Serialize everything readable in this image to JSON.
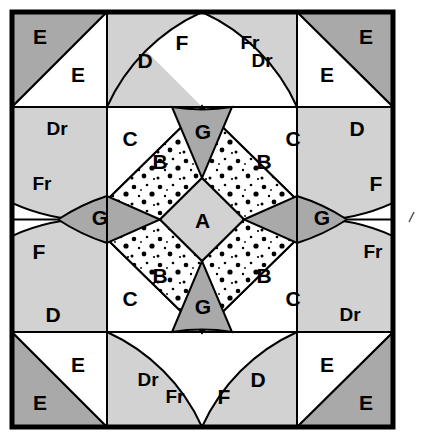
{
  "diagram": {
    "type": "quilt-block-pattern",
    "grid": {
      "rows": 4,
      "columns": 4,
      "block_left": 12,
      "block_top": 12,
      "block_size": 381,
      "cell_size": 95.25
    },
    "colors": {
      "background": "#ffffff",
      "outline": "#000000",
      "fabric_light": "#ffffff",
      "fabric_medium": "#d2d2d2",
      "fabric_dark": "#a9a9a9",
      "fabric_dotted_base": "#ffffff",
      "dot_color": "#000000",
      "border": "#000000"
    },
    "border_width": 4,
    "line_width": 2
  },
  "labels": {
    "center": "A",
    "dotted": "B",
    "triangle_c": "C",
    "triangle_d": "D",
    "triangle_dr": "Dr",
    "corner_dark": "E",
    "corner_light": "E",
    "wedge_f": "F",
    "wedge_fr": "Fr",
    "kite_g": "G"
  },
  "pieces": [
    {
      "id": "A",
      "label": "A",
      "name": "center-diamond",
      "fabric": "medium",
      "x": 202.5,
      "y": 222.0
    },
    {
      "id": "B1",
      "label": "B",
      "name": "dotted-diamond-top-left",
      "fabric": "dotted",
      "x": 160.0,
      "y": 163.0
    },
    {
      "id": "B2",
      "label": "B",
      "name": "dotted-diamond-top-right",
      "fabric": "dotted",
      "x": 264.0,
      "y": 163.0
    },
    {
      "id": "B3",
      "label": "B",
      "name": "dotted-diamond-bottom-left",
      "fabric": "dotted",
      "x": 160.0,
      "y": 277.0
    },
    {
      "id": "B4",
      "label": "B",
      "name": "dotted-diamond-bottom-right",
      "fabric": "dotted",
      "x": 264.0,
      "y": 277.0
    },
    {
      "id": "G1",
      "label": "G",
      "name": "kite-top",
      "fabric": "dark",
      "x": 203.0,
      "y": 110.0
    },
    {
      "id": "G2",
      "label": "G",
      "name": "kite-right",
      "fabric": "dark",
      "x": 325.0,
      "y": 215.0
    },
    {
      "id": "G3",
      "label": "G",
      "name": "kite-bottom",
      "fabric": "dark",
      "x": 203.0,
      "y": 330.0
    },
    {
      "id": "G4",
      "label": "G",
      "name": "kite-left",
      "fabric": "dark",
      "x": 98.0,
      "y": 215.0
    },
    {
      "id": "C1",
      "label": "C",
      "name": "triangle-c-top-left",
      "fabric": "light",
      "x": 124.0,
      "y": 126.0
    },
    {
      "id": "C2",
      "label": "C",
      "name": "triangle-c-top-right",
      "fabric": "light",
      "x": 299.0,
      "y": 126.0
    },
    {
      "id": "C3",
      "label": "C",
      "name": "triangle-c-bottom-left",
      "fabric": "light",
      "x": 124.0,
      "y": 316.0
    },
    {
      "id": "C4",
      "label": "C",
      "name": "triangle-c-bottom-right",
      "fabric": "light",
      "x": 299.0,
      "y": 316.0
    },
    {
      "id": "D1",
      "label": "D",
      "name": "triangle-d-top",
      "fabric": "medium",
      "x": 148.0,
      "y": 63.0
    },
    {
      "id": "Dr1",
      "label": "Dr",
      "name": "triangle-dr-left",
      "fabric": "medium",
      "x": 58.0,
      "y": 130.0
    },
    {
      "id": "D2",
      "label": "D",
      "name": "triangle-d-right",
      "fabric": "medium",
      "x": 357.0,
      "y": 130.0
    },
    {
      "id": "Dr2",
      "label": "Dr",
      "name": "triangle-dr-top",
      "fabric": "medium",
      "x": 260.0,
      "y": 63.0
    },
    {
      "id": "D3",
      "label": "D",
      "name": "triangle-d-bottom",
      "fabric": "medium",
      "x": 260.0,
      "y": 381.0
    },
    {
      "id": "Dr3",
      "label": "Dr",
      "name": "triangle-dr-right",
      "fabric": "medium",
      "x": 348.0,
      "y": 316.0
    },
    {
      "id": "D4",
      "label": "D",
      "name": "triangle-d-left",
      "fabric": "medium",
      "x": 54.0,
      "y": 316.0
    },
    {
      "id": "Dr4",
      "label": "Dr",
      "name": "triangle-dr-bottom",
      "fabric": "medium",
      "x": 146.0,
      "y": 381.0
    },
    {
      "id": "F1",
      "label": "F",
      "name": "wedge-f-top",
      "fabric": "light",
      "x": 182.0,
      "y": 44.0
    },
    {
      "id": "Fr1",
      "label": "Fr",
      "name": "wedge-fr-top",
      "fabric": "light",
      "x": 248.0,
      "y": 44.0
    },
    {
      "id": "F2",
      "label": "F",
      "name": "wedge-f-right",
      "fabric": "light",
      "x": 377.0,
      "y": 185.0
    },
    {
      "id": "Fr2",
      "label": "Fr",
      "name": "wedge-fr-right",
      "fabric": "light",
      "x": 377.0,
      "y": 253.0
    },
    {
      "id": "F3",
      "label": "F",
      "name": "wedge-f-bottom",
      "fabric": "light",
      "x": 222.0,
      "y": 399.0
    },
    {
      "id": "Fr3",
      "label": "Fr",
      "name": "wedge-fr-bottom",
      "fabric": "light",
      "x": 173.0,
      "y": 399.0
    },
    {
      "id": "F4",
      "label": "F",
      "name": "wedge-f-left",
      "fabric": "light",
      "x": 39.0,
      "y": 253.0
    },
    {
      "id": "Fr4",
      "label": "Fr",
      "name": "wedge-fr-left",
      "fabric": "light",
      "x": 39.0,
      "y": 185.0
    },
    {
      "id": "E1a",
      "label": "E",
      "name": "corner-dark-top-left",
      "fabric": "dark",
      "x": 38.0,
      "y": 39.0
    },
    {
      "id": "E1b",
      "label": "E",
      "name": "corner-light-top-left",
      "fabric": "light",
      "x": 78.0,
      "y": 76.0
    },
    {
      "id": "E2a",
      "label": "E",
      "name": "corner-dark-top-right",
      "fabric": "dark",
      "x": 366.0,
      "y": 39.0
    },
    {
      "id": "E2b",
      "label": "E",
      "name": "corner-light-top-right",
      "fabric": "light",
      "x": 325.0,
      "y": 76.0
    },
    {
      "id": "E3a",
      "label": "E",
      "name": "corner-dark-bottom-right",
      "fabric": "dark",
      "x": 366.0,
      "y": 404.0
    },
    {
      "id": "E3b",
      "label": "E",
      "name": "corner-light-bottom-right",
      "fabric": "light",
      "x": 325.0,
      "y": 367.0
    },
    {
      "id": "E4a",
      "label": "E",
      "name": "corner-dark-bottom-left",
      "fabric": "dark",
      "x": 38.0,
      "y": 404.0
    },
    {
      "id": "E4b",
      "label": "E",
      "name": "corner-light-bottom-left",
      "fabric": "light",
      "x": 78.0,
      "y": 367.0
    }
  ],
  "legend_note": ""
}
